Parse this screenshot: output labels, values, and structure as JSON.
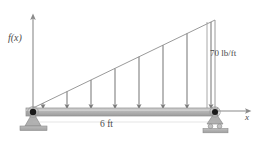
{
  "diagram": {
    "type": "beam-load-diagram",
    "labels": {
      "y_axis": "f(x)",
      "x_axis": "x",
      "load_intensity": "70 lb/ft",
      "span": "6 ft"
    },
    "beam": {
      "span_value": 6,
      "span_units": "ft",
      "color": "#b3b3b3",
      "edge_color": "#8c8c8c"
    },
    "load": {
      "shape": "triangular",
      "peak_value": 70,
      "peak_units": "lb/ft",
      "start_value": 0,
      "increases_toward": "right",
      "arrow_count": 8,
      "arrow_color": "#7a7a7a",
      "outline_color": "#9a9a9a"
    },
    "supports": {
      "left": {
        "kind": "pin",
        "name": "pin-support"
      },
      "right": {
        "kind": "roller",
        "name": "roller-support"
      },
      "base_color": "#aaaaaa",
      "pin_color": "#1a1a1a"
    },
    "axes": {
      "origin_x": 33,
      "origin_y": 111,
      "color": "#8a8a8a"
    },
    "colors": {
      "line": "#8a8a8a",
      "text": "#4a4a4a",
      "background": "#ffffff"
    }
  }
}
